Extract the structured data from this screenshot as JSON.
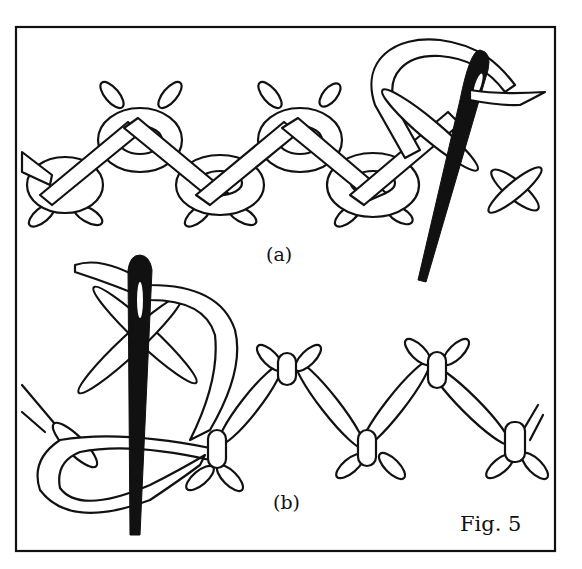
{
  "figure": {
    "title": "Fig. 5",
    "border_color": "#111111",
    "background": "#ffffff"
  },
  "panels": [
    {
      "id": "a",
      "label": "(a)",
      "description": "Zigzag stitches with looped knots at each point; needle passing diagonally through at right"
    },
    {
      "id": "b",
      "label": "(b)",
      "description": "Cross stitches tied with small wrapping knots at each zigzag point; vertical needle with thread loop at left"
    }
  ]
}
